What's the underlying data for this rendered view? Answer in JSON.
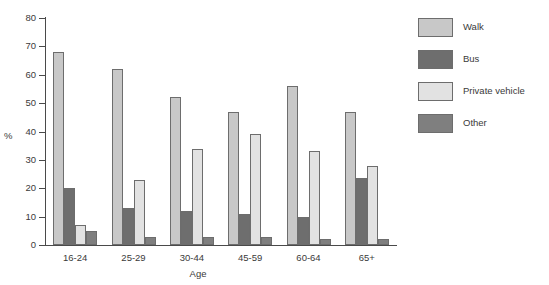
{
  "chart_data": {
    "type": "bar",
    "title": "",
    "subtitle": "",
    "xlabel": "Age",
    "ylabel": "%",
    "ylim": [
      0,
      80
    ],
    "ytick_step": 10,
    "yticks": [
      0,
      10,
      20,
      30,
      40,
      50,
      60,
      70,
      80
    ],
    "grid": false,
    "legend_position": "right",
    "categories": [
      "16-24",
      "25-29",
      "30-44",
      "45-59",
      "60-64",
      "65+"
    ],
    "series": [
      {
        "name": "Walk",
        "color": "#c8c8c8",
        "values": [
          68,
          62,
          52,
          47,
          56,
          47
        ]
      },
      {
        "name": "Bus",
        "color": "#6e6e6e",
        "values": [
          20,
          13,
          12,
          11,
          10,
          23.5
        ]
      },
      {
        "name": "Private vehicle",
        "color": "#e2e2e2",
        "values": [
          7,
          23,
          34,
          39,
          33,
          28
        ]
      },
      {
        "name": "Other",
        "color": "#7f7f7f",
        "values": [
          5,
          3,
          3,
          3,
          2,
          2
        ]
      }
    ]
  },
  "axis": {
    "y_title": "%",
    "x_title": "Age",
    "y_tick_labels": [
      "80",
      "70",
      "60",
      "50",
      "40",
      "30",
      "20",
      "10",
      "0"
    ],
    "x_tick_labels": [
      "16-24",
      "25-29",
      "30-44",
      "45-59",
      "60-64",
      "65+"
    ]
  },
  "legend": {
    "items": [
      {
        "label": "Walk",
        "color": "#c8c8c8"
      },
      {
        "label": "Bus",
        "color": "#6e6e6e"
      },
      {
        "label": "Private vehicle",
        "color": "#e2e2e2"
      },
      {
        "label": "Other",
        "color": "#7f7f7f"
      }
    ]
  },
  "colors": {
    "axis": "#4a4a4a",
    "text": "#3a3a3a",
    "bar_outline": "#6d6d6d",
    "background": "#ffffff"
  }
}
